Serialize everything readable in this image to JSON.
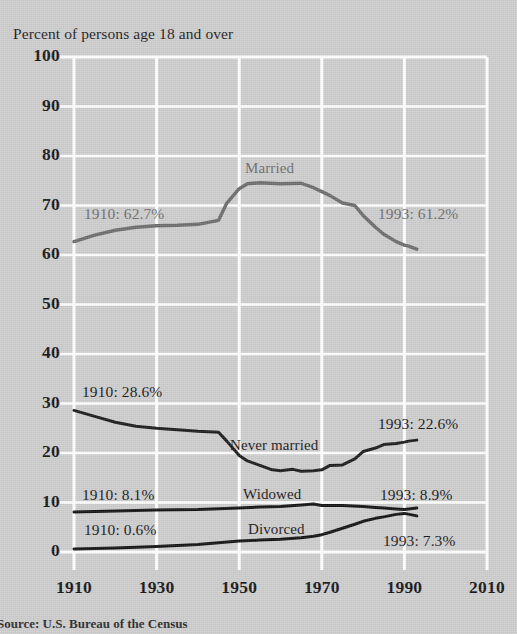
{
  "chart_data": {
    "type": "line",
    "title": "Percent of persons age 18 and over",
    "xlabel": "",
    "ylabel": "Percent of persons age 18 and over",
    "xlim": [
      1910,
      2010
    ],
    "ylim": [
      0,
      100
    ],
    "grid": true,
    "legend": "inline-labels",
    "xticks": [
      "1910",
      "1930",
      "1950",
      "1970",
      "1990",
      "2010"
    ],
    "yticks": [
      "0",
      "10",
      "20",
      "30",
      "40",
      "50",
      "60",
      "70",
      "80",
      "90",
      "100"
    ],
    "source": "Source: U.S. Bureau of the Census",
    "series": [
      {
        "name": "Married",
        "color": "#6c6c6c",
        "label": "Married",
        "start_annotation": "1910: 62.7%",
        "end_annotation": "1993: 61.2%",
        "x": [
          1910,
          1915,
          1920,
          1925,
          1930,
          1935,
          1940,
          1945,
          1947,
          1950,
          1952,
          1955,
          1960,
          1965,
          1968,
          1970,
          1972,
          1975,
          1978,
          1980,
          1983,
          1985,
          1988,
          1990,
          1991,
          1993
        ],
        "values": [
          62.7,
          64.0,
          65.0,
          65.6,
          65.9,
          66.0,
          66.2,
          67.0,
          70.5,
          73.4,
          74.4,
          74.6,
          74.4,
          74.5,
          73.6,
          72.8,
          72.0,
          70.5,
          70.0,
          68.0,
          65.6,
          64.2,
          62.7,
          62.0,
          61.8,
          61.2
        ]
      },
      {
        "name": "Never married",
        "color": "#1a1a1a",
        "label": "Never married",
        "start_annotation": "1910: 28.6%",
        "end_annotation": "1993: 22.6%",
        "x": [
          1910,
          1915,
          1920,
          1925,
          1930,
          1935,
          1940,
          1945,
          1947,
          1950,
          1952,
          1955,
          1958,
          1960,
          1963,
          1965,
          1968,
          1970,
          1972,
          1975,
          1978,
          1980,
          1983,
          1985,
          1988,
          1990,
          1991,
          1993
        ],
        "values": [
          28.6,
          27.4,
          26.2,
          25.4,
          25.0,
          24.7,
          24.4,
          24.2,
          22.4,
          19.5,
          18.4,
          17.5,
          16.6,
          16.4,
          16.7,
          16.3,
          16.4,
          16.6,
          17.5,
          17.6,
          18.8,
          20.3,
          21.0,
          21.7,
          21.9,
          22.2,
          22.4,
          22.6
        ]
      },
      {
        "name": "Widowed",
        "color": "#111111",
        "label": "Widowed",
        "start_annotation": "1910: 8.1%",
        "end_annotation": "1993: 8.9%",
        "x": [
          1910,
          1920,
          1930,
          1940,
          1950,
          1955,
          1960,
          1965,
          1968,
          1970,
          1975,
          1980,
          1983,
          1985,
          1988,
          1990,
          1993
        ],
        "values": [
          8.1,
          8.3,
          8.5,
          8.6,
          8.9,
          9.1,
          9.2,
          9.5,
          9.7,
          9.4,
          9.4,
          9.2,
          9.0,
          8.9,
          8.7,
          8.6,
          8.9
        ]
      },
      {
        "name": "Divorced",
        "color": "#111111",
        "label": "Divorced",
        "start_annotation": "1910: 0.6%",
        "end_annotation": "1993: 7.3%",
        "x": [
          1910,
          1920,
          1930,
          1940,
          1950,
          1955,
          1960,
          1965,
          1968,
          1970,
          1972,
          1975,
          1978,
          1980,
          1983,
          1985,
          1988,
          1990,
          1993
        ],
        "values": [
          0.6,
          0.8,
          1.1,
          1.5,
          2.2,
          2.4,
          2.6,
          2.9,
          3.2,
          3.5,
          4.0,
          4.8,
          5.6,
          6.2,
          6.8,
          7.1,
          7.6,
          7.8,
          7.3
        ]
      }
    ]
  },
  "figure": {
    "title": "Percent of persons age 18 and over",
    "source": "Source: U.S. Bureau of the Census",
    "background_color": "#cdcdcd",
    "gridline_color": "#ffffff"
  },
  "annotations": {
    "married_start": "1910: 62.7%",
    "married_end": "1993: 61.2%",
    "never_married_start": "1910: 28.6%",
    "never_married_end": "1993: 22.6%",
    "widowed_start": "1910: 8.1%",
    "widowed_end": "1993: 8.9%",
    "divorced_start": "1910: 0.6%",
    "divorced_end": "1993: 7.3%"
  },
  "labels": {
    "married": "Married",
    "never_married": "Never married",
    "widowed": "Widowed",
    "divorced": "Divorced"
  },
  "ticks": {
    "y": [
      "100",
      "90",
      "80",
      "70",
      "60",
      "50",
      "40",
      "30",
      "20",
      "10",
      "0"
    ],
    "x": [
      "1910",
      "1930",
      "1950",
      "1970",
      "1990",
      "2010"
    ]
  }
}
